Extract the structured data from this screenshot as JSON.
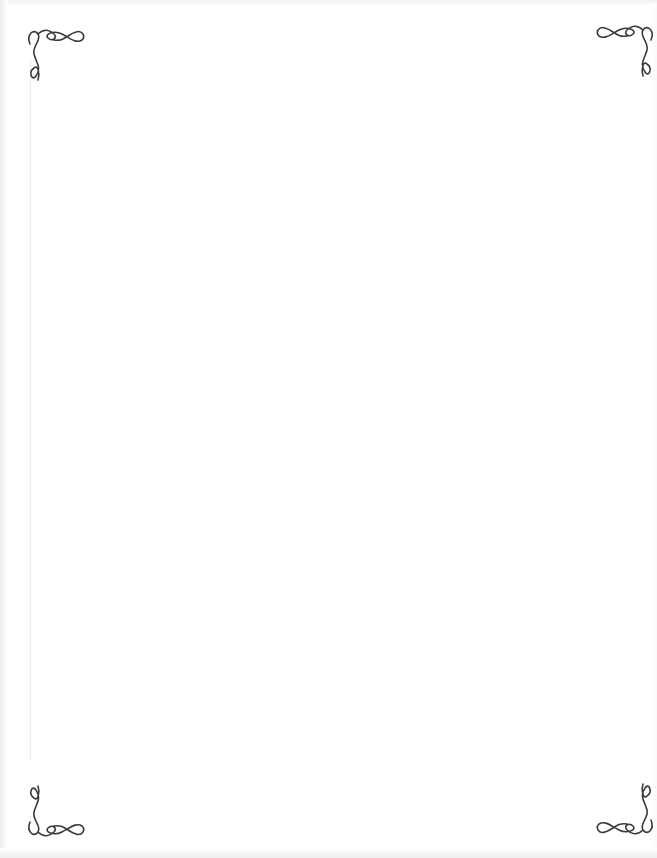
{
  "page": {
    "type": "blank-decorative-page",
    "background_color": "#ffffff",
    "ornament_color": "#3a3a3a"
  },
  "ornaments": [
    {
      "position": "top-left",
      "icon": "corner-flourish-icon"
    },
    {
      "position": "top-right",
      "icon": "corner-flourish-icon"
    },
    {
      "position": "bottom-left",
      "icon": "corner-flourish-icon"
    },
    {
      "position": "bottom-right",
      "icon": "corner-flourish-icon"
    }
  ]
}
